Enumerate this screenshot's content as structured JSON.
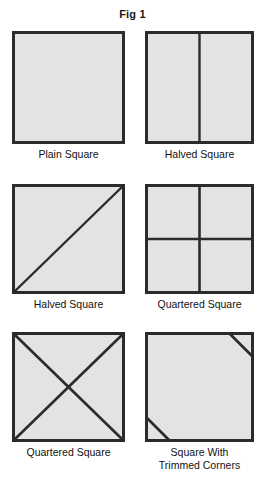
{
  "figure": {
    "title": "Fig 1",
    "background_color": "#ffffff",
    "fill_color": "#e3e3e3",
    "stroke_color": "#2b2b2b",
    "panels": [
      {
        "id": "plain-square",
        "label": "Plain Square",
        "shape": "square",
        "divisions": [],
        "x": 12,
        "y": 31,
        "size": 113
      },
      {
        "id": "halved-square-vertical",
        "label": "Halved Square",
        "shape": "square",
        "divisions": [
          "vertical-center"
        ],
        "x": 145,
        "y": 31,
        "size": 109
      },
      {
        "id": "halved-square-diagonal",
        "label": "Halved Square",
        "shape": "square",
        "divisions": [
          "diagonal-bl-tr"
        ],
        "x": 12,
        "y": 184,
        "size": 113
      },
      {
        "id": "quartered-square-cross",
        "label": "Quartered Square",
        "shape": "square",
        "divisions": [
          "vertical-center",
          "horizontal-center"
        ],
        "x": 145,
        "y": 184,
        "size": 109
      },
      {
        "id": "quartered-square-diagonals",
        "label": "Quartered Square",
        "shape": "square",
        "divisions": [
          "diagonal-bl-tr",
          "diagonal-tl-br"
        ],
        "x": 12,
        "y": 332,
        "size": 113
      },
      {
        "id": "square-with-trimmed-corners",
        "label": "Square With\nTrimmed Corners",
        "shape": "square",
        "divisions": [
          "trim-top-right",
          "trim-bottom-left"
        ],
        "x": 145,
        "y": 332,
        "size": 109
      }
    ]
  }
}
